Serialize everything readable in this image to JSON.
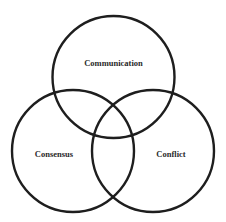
{
  "diagram": {
    "type": "venn",
    "sets": [
      {
        "id": "communication",
        "label": "Communication",
        "cx": 113.5,
        "cy": 77,
        "r": 61,
        "label_x": 113.5,
        "label_y": 64
      },
      {
        "id": "consensus",
        "label": "Consensus",
        "cx": 73,
        "cy": 151,
        "r": 61,
        "label_x": 54,
        "label_y": 155
      },
      {
        "id": "conflict",
        "label": "Conflict",
        "cx": 153,
        "cy": 151,
        "r": 61,
        "label_x": 171,
        "label_y": 155
      }
    ],
    "stroke_color": "#1e1e1e",
    "text_color": "#2a2a2a",
    "background": "#ffffff"
  }
}
